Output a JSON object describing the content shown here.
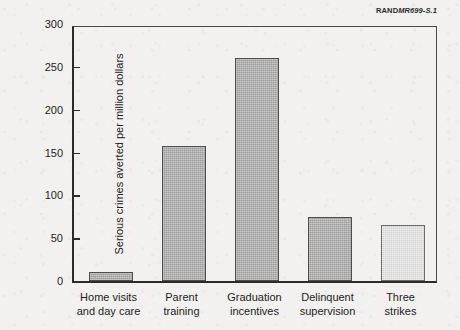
{
  "figure_id": {
    "rand_mark": "RAND",
    "doc_no": "MR699-S.1"
  },
  "chart_data": {
    "type": "bar",
    "title": "",
    "xlabel": "",
    "ylabel": "Serious crimes averted per million dollars",
    "ylim": [
      0,
      300
    ],
    "yticks": [
      0,
      50,
      100,
      150,
      200,
      250,
      300
    ],
    "ytick_labels": [
      "0",
      "50",
      "100",
      "150",
      "200",
      "250",
      "300"
    ],
    "grid": false,
    "legend": "none",
    "categories": [
      "Home visits and day care",
      "Parent training",
      "Graduation incentives",
      "Delinquent supervision",
      "Three strikes"
    ],
    "category_lines": [
      [
        "Home visits",
        "and day care"
      ],
      [
        "Parent",
        "training"
      ],
      [
        "Graduation",
        "incentives"
      ],
      [
        "Delinquent",
        "supervision"
      ],
      [
        "Three",
        "strikes"
      ]
    ],
    "values": [
      11,
      158,
      260,
      75,
      65
    ],
    "bar_colors": [
      "#9a9a9a",
      "#9a9a9a",
      "#9a9a9a",
      "#9a9a9a",
      "#d2d2d2"
    ]
  },
  "colors": {
    "background": "#f2f1ef",
    "axis": "#2b2b2b",
    "bar_fill": "#9a9a9a",
    "bar_fill_light": "#d2d2d2",
    "bar_edge": "#4e4e4e",
    "text": "#1d1d1d"
  }
}
